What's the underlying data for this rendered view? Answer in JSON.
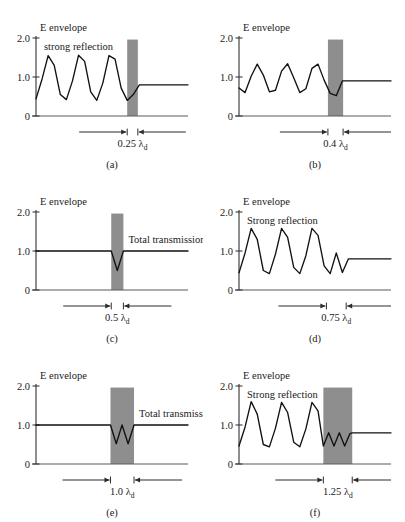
{
  "figure": {
    "axis_title": "E envelope",
    "y_ticks": [
      "2.0",
      "1.0",
      "0"
    ],
    "lambda_symbol": "λ",
    "lambda_subscript": "d",
    "slab_color": "#8e8e8e",
    "curve_color": "#111111"
  },
  "chart_data": {
    "type": "line",
    "xlabel": "",
    "ylabel": "E envelope",
    "ylim": [
      0,
      2.0
    ],
    "yticks": [
      0,
      1.0,
      2.0
    ],
    "grid": false,
    "legend": "none",
    "panels": [
      {
        "tag": "(a)",
        "annotation": "strong reflection",
        "thickness_label": "0.25",
        "thickness_value": 0.25,
        "slab_visible": true,
        "slab_x_start": 0.6,
        "slab_x_end": 0.67,
        "incident_ripple": {
          "cycles": 3.25,
          "max": 1.58,
          "min": 0.4,
          "mean": 0.99
        },
        "transmitted_level": 0.8,
        "interior_ripple_cycles": 0,
        "x": [
          0.0,
          0.04,
          0.08,
          0.12,
          0.16,
          0.2,
          0.24,
          0.28,
          0.32,
          0.36,
          0.4,
          0.44,
          0.48,
          0.52,
          0.56,
          0.6,
          0.64,
          0.68,
          0.72,
          0.8,
          0.9,
          1.0
        ],
        "y": [
          0.44,
          0.95,
          1.55,
          1.3,
          0.55,
          0.42,
          0.9,
          1.56,
          1.4,
          0.62,
          0.4,
          0.85,
          1.55,
          1.46,
          0.72,
          0.4,
          0.55,
          0.8,
          0.8,
          0.8,
          0.8,
          0.8
        ]
      },
      {
        "tag": "(b)",
        "annotation": "",
        "thickness_label": "0.4",
        "thickness_value": 0.4,
        "slab_visible": true,
        "slab_x_start": 0.585,
        "slab_x_end": 0.685,
        "incident_ripple": {
          "cycles": 3.25,
          "max": 1.35,
          "min": 0.58,
          "mean": 0.96
        },
        "transmitted_level": 0.9,
        "interior_ripple_cycles": 0,
        "x": [
          0.0,
          0.04,
          0.08,
          0.12,
          0.16,
          0.2,
          0.24,
          0.28,
          0.32,
          0.36,
          0.4,
          0.44,
          0.48,
          0.52,
          0.56,
          0.6,
          0.64,
          0.68,
          0.72,
          0.8,
          0.9,
          1.0
        ],
        "y": [
          0.72,
          0.6,
          1.02,
          1.33,
          1.05,
          0.62,
          0.66,
          1.15,
          1.34,
          0.98,
          0.6,
          0.7,
          1.22,
          1.33,
          0.92,
          0.58,
          0.52,
          0.9,
          0.9,
          0.9,
          0.9,
          0.9
        ]
      },
      {
        "tag": "(c)",
        "annotation": "Total transmission",
        "thickness_label": "0.5",
        "thickness_value": 0.5,
        "slab_visible": true,
        "slab_x_start": 0.495,
        "slab_x_end": 0.575,
        "incident_ripple": {
          "cycles": 0,
          "max": 1.0,
          "min": 1.0,
          "mean": 1.0
        },
        "transmitted_level": 1.0,
        "interior_ripple_cycles": 0.5,
        "interior_min": 0.5,
        "x": [
          0.0,
          0.2,
          0.4,
          0.495,
          0.535,
          0.575,
          0.7,
          0.85,
          1.0
        ],
        "y": [
          1.0,
          1.0,
          1.0,
          1.0,
          0.5,
          1.0,
          1.0,
          1.0,
          1.0
        ]
      },
      {
        "tag": "(d)",
        "annotation": "Strong reflection",
        "thickness_label": "0.75",
        "thickness_value": 0.75,
        "slab_visible": false,
        "slab_x_start": 0.575,
        "slab_x_end": 0.705,
        "incident_ripple": {
          "cycles": 3.25,
          "max": 1.6,
          "min": 0.42,
          "mean": 1.01
        },
        "transmitted_level": 0.8,
        "interior_ripple_cycles": 1.0,
        "x": [
          0.0,
          0.04,
          0.08,
          0.12,
          0.16,
          0.2,
          0.24,
          0.28,
          0.32,
          0.36,
          0.4,
          0.44,
          0.48,
          0.52,
          0.56,
          0.6,
          0.64,
          0.68,
          0.72,
          0.8,
          0.9,
          1.0
        ],
        "y": [
          0.44,
          0.95,
          1.58,
          1.3,
          0.5,
          0.42,
          0.92,
          1.58,
          1.35,
          0.58,
          0.42,
          0.88,
          1.58,
          1.4,
          0.62,
          0.42,
          0.95,
          0.45,
          0.8,
          0.8,
          0.8,
          0.8
        ]
      },
      {
        "tag": "(e)",
        "annotation": "Total transmission",
        "thickness_label": "1.0",
        "thickness_value": 1.0,
        "slab_visible": true,
        "slab_x_start": 0.49,
        "slab_x_end": 0.645,
        "incident_ripple": {
          "cycles": 0,
          "max": 1.0,
          "min": 1.0,
          "mean": 1.0
        },
        "transmitted_level": 1.0,
        "interior_ripple_cycles": 1.5,
        "interior_min": 0.52,
        "x": [
          0.0,
          0.2,
          0.4,
          0.49,
          0.528,
          0.566,
          0.606,
          0.645,
          0.78,
          0.9,
          1.0
        ],
        "y": [
          1.0,
          1.0,
          1.0,
          1.0,
          0.52,
          1.0,
          0.52,
          1.0,
          1.0,
          1.0,
          1.0
        ]
      },
      {
        "tag": "(f)",
        "annotation": "Strong reflection",
        "thickness_label": "1.25",
        "thickness_value": 1.25,
        "slab_visible": true,
        "slab_x_start": 0.555,
        "slab_x_end": 0.745,
        "incident_ripple": {
          "cycles": 3.25,
          "max": 1.6,
          "min": 0.42,
          "mean": 1.01
        },
        "transmitted_level": 0.8,
        "interior_ripple_cycles": 2.5,
        "x": [
          0.0,
          0.04,
          0.08,
          0.12,
          0.16,
          0.2,
          0.24,
          0.28,
          0.32,
          0.36,
          0.4,
          0.44,
          0.48,
          0.52,
          0.555,
          0.59,
          0.625,
          0.66,
          0.695,
          0.73,
          0.745,
          0.85,
          1.0
        ],
        "y": [
          0.46,
          0.95,
          1.6,
          1.28,
          0.5,
          0.44,
          0.92,
          1.58,
          1.32,
          0.56,
          0.44,
          0.9,
          1.58,
          1.36,
          0.46,
          0.8,
          0.46,
          0.8,
          0.46,
          0.78,
          0.8,
          0.8,
          0.8
        ]
      }
    ]
  }
}
